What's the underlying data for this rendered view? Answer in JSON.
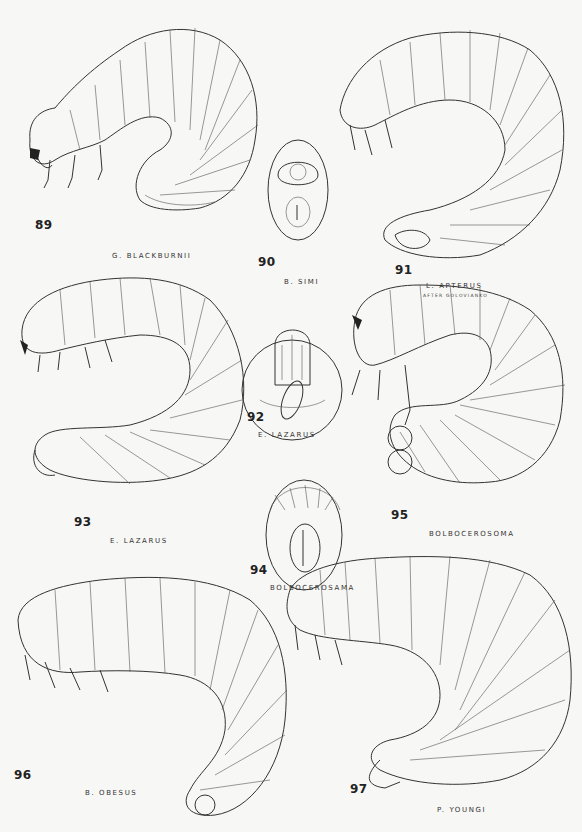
{
  "plate": {
    "figures": [
      {
        "number": "89",
        "caption": "G. BLACKBURNII",
        "subcaption": ""
      },
      {
        "number": "90",
        "caption": "B. SIMI",
        "subcaption": ""
      },
      {
        "number": "91",
        "caption": "L. APTERUS",
        "subcaption": "AFTER GOLOVIANKO"
      },
      {
        "number": "92",
        "caption": "E. LAZARUS",
        "subcaption": ""
      },
      {
        "number": "93",
        "caption": "E. LAZARUS",
        "subcaption": ""
      },
      {
        "number": "94",
        "caption": "BOLBOCEROSAMA",
        "subcaption": ""
      },
      {
        "number": "95",
        "caption": "BOLBOCEROSOMA",
        "subcaption": ""
      },
      {
        "number": "96",
        "caption": "B. OBESUS",
        "subcaption": ""
      },
      {
        "number": "97",
        "caption": "P. YOUNGI",
        "subcaption": ""
      }
    ]
  }
}
